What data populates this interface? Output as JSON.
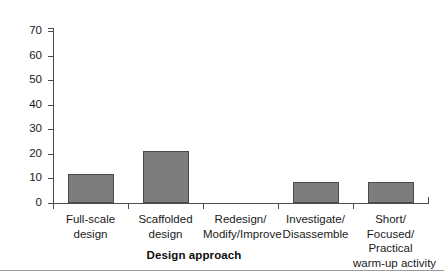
{
  "chart_data": {
    "type": "bar",
    "title": "",
    "subtitle": "",
    "xlabel": "Design approach",
    "ylabel": "",
    "ylim": [
      0,
      70
    ],
    "ytick_step": 10,
    "grid": false,
    "legend": null,
    "bar_color": "#7d7d7d",
    "bar_edge_color": "#4a4a4a",
    "axis_color": "#4d4d4d",
    "categories": [
      "Full-scale design",
      "Scaffolded design",
      "Redesign/ Modify/Improve",
      "Investigate/ Disassemble",
      "Short/ Focused/ Practical warm-up activity"
    ],
    "category_lines": [
      [
        "Full-scale",
        "design"
      ],
      [
        "Scaffolded",
        "design"
      ],
      [
        "Redesign/",
        "Modify/Improve"
      ],
      [
        "Investigate/",
        "Disassemble"
      ],
      [
        "Short/",
        "Focused/",
        "Practical",
        "warm-up activity"
      ]
    ],
    "values": [
      12,
      21,
      0,
      8.5,
      8.5
    ],
    "ytick_labels": [
      "70",
      "60",
      "50",
      "40",
      "30",
      "20",
      "10",
      "0"
    ],
    "ytick_values": [
      70,
      60,
      50,
      40,
      30,
      20,
      10,
      0
    ]
  }
}
